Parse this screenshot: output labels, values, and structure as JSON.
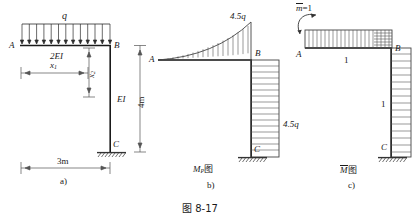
{
  "figure": {
    "caption": "图  8-17",
    "subfigures": [
      {
        "key": "a",
        "label": "a)",
        "title": ""
      },
      {
        "key": "b",
        "label": "b)",
        "title": "M"
      },
      {
        "key": "c",
        "label": "c)",
        "title": "M"
      }
    ]
  },
  "diagram_a": {
    "panel_label": "a)",
    "load_label": "q",
    "node_a": "A",
    "node_b": "B",
    "node_c": "C",
    "beam_stiffness": "2EI",
    "column_stiffness": "EI",
    "dim_x1": "x",
    "dim_x1_sub": "1",
    "dim_x2": "x",
    "dim_x2_sub": "2",
    "dim_span": "3m",
    "dim_height": "4m",
    "load_arrow_count": 13
  },
  "diagram_b": {
    "panel_label": "b)",
    "diagram_title": "M",
    "diagram_title_sub": "P",
    "diagram_title_suffix": "图",
    "node_a": "A",
    "node_b": "B",
    "node_c": "C",
    "value_beam": "4.5q",
    "value_column": "4.5q",
    "hatch_lines_beam": 18,
    "hatch_lines_column": 16
  },
  "diagram_c": {
    "panel_label": "c)",
    "diagram_title": "M",
    "diagram_title_suffix": "图",
    "unit_moment": "m",
    "unit_moment_value": "=1",
    "node_a": "A",
    "node_b": "B",
    "node_c": "C",
    "value_beam": "1",
    "value_column": "1",
    "hatch_lines_beam": 22,
    "hatch_lines_column": 16
  },
  "colors": {
    "ink": "#1a1a1a",
    "line": "#2b2b2b",
    "hatch": "#555555",
    "ground": "#333333"
  }
}
